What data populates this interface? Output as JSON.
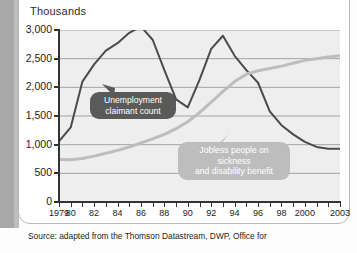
{
  "figure": {
    "axis_title": "Thousands",
    "source": "Source: adapted from the Thomson Datastream, DWP, Office for"
  },
  "callouts": {
    "unemployment": "Unemployment\nclaimant count",
    "sickness": "Jobless people on sickness\nand disability benefit"
  },
  "chart_data": {
    "type": "line",
    "title": "",
    "subtitle": "",
    "xlabel": "",
    "ylabel": "Thousands",
    "ylim": [
      0,
      3000
    ],
    "xlim": [
      1979,
      2003
    ],
    "yticks": [
      0,
      500,
      1000,
      1500,
      2000,
      2500,
      3000
    ],
    "ytick_labels": [
      "0",
      "500",
      "1,000",
      "1,500",
      "2,000",
      "2,500",
      "3,000"
    ],
    "xticks": [
      1979,
      1980,
      1982,
      1984,
      1986,
      1988,
      1990,
      1992,
      1994,
      1996,
      1998,
      2000,
      2003
    ],
    "xtick_labels": [
      "1979",
      "80",
      "82",
      "84",
      "86",
      "88",
      "90",
      "92",
      "94",
      "96",
      "98",
      "2000",
      "2003"
    ],
    "minor_xticks_every": 1,
    "grid": "horizontal",
    "grid_color": "#8f8f8f",
    "plot_background": "#ededed",
    "legend_position": "inline-callouts",
    "series": [
      {
        "name": "Unemployment claimant count",
        "color": "#4b4b4b",
        "width": 2.0,
        "x": [
          1979,
          1980,
          1981,
          1982,
          1983,
          1984,
          1985,
          1986,
          1987,
          1988,
          1989,
          1990,
          1991,
          1992,
          1993,
          1994,
          1995,
          1996,
          1997,
          1998,
          1999,
          2000,
          2001,
          2002,
          2003
        ],
        "values": [
          1060,
          1300,
          2100,
          2400,
          2640,
          2770,
          2950,
          3060,
          2830,
          2300,
          1790,
          1650,
          2130,
          2670,
          2900,
          2550,
          2300,
          2080,
          1580,
          1340,
          1180,
          1050,
          960,
          930,
          930
        ]
      },
      {
        "name": "Jobless people on sickness and disability benefit",
        "color": "#bdbdbd",
        "width": 3.0,
        "x": [
          1979,
          1980,
          1981,
          1982,
          1983,
          1984,
          1985,
          1986,
          1987,
          1988,
          1989,
          1990,
          1991,
          1992,
          1993,
          1994,
          1995,
          1996,
          1997,
          1998,
          1999,
          2000,
          2001,
          2002,
          2003
        ],
        "values": [
          740,
          735,
          760,
          800,
          850,
          900,
          960,
          1030,
          1100,
          1180,
          1280,
          1400,
          1560,
          1740,
          1930,
          2100,
          2230,
          2290,
          2330,
          2370,
          2420,
          2470,
          2500,
          2530,
          2550
        ]
      }
    ],
    "annotations": [
      {
        "text": "Unemployment claimant count",
        "target_series": "Unemployment claimant count",
        "at_x": 1983
      },
      {
        "text": "Jobless people on sickness and disability benefit",
        "target_series": "Jobless people on sickness and disability benefit",
        "at_x": 1996
      }
    ]
  }
}
